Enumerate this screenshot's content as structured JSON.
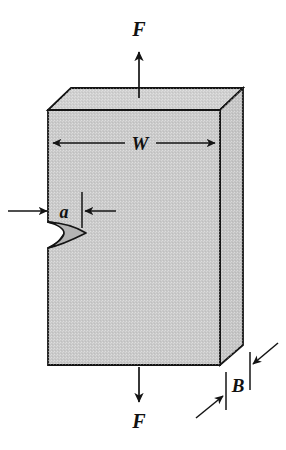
{
  "figure": {
    "type": "engineering-diagram",
    "background_color": "#ffffff",
    "line_color": "#141414",
    "body_fill_color": "#c9c9c9",
    "crack_fill_color": "#b0b0b0",
    "top_face_fill_color": "#cccccc",
    "side_face_fill_color": "#c4c4c4"
  },
  "labels": {
    "force_top": "F",
    "force_bottom": "F",
    "width": "W",
    "crack_length": "a",
    "thickness": "B"
  },
  "annotations": {
    "force_top_direction": "up",
    "force_bottom_direction": "down",
    "width_dimension_style": "double-headed-arrow",
    "crack_dimension_style": "inward-arrows-with-extension-ticks",
    "thickness_dimension_style": "inward-diagonal-arrows-with-ticks"
  },
  "geometry": {
    "front_face": {
      "left_x": 48,
      "right_x": 220,
      "top_y": 110,
      "bottom_y": 365,
      "notch_top_y": 222,
      "notch_bottom_y": 248
    },
    "depth_offset": {
      "dx": 23,
      "dy": -22
    },
    "crack_tip_x": 86,
    "crack_mouth_x": 48
  }
}
